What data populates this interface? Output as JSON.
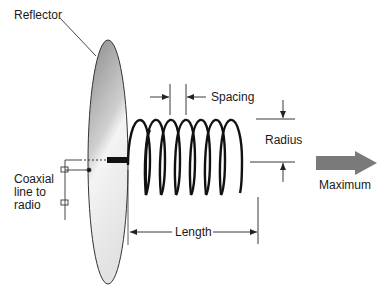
{
  "diagram": {
    "type": "helical antenna",
    "labels": {
      "reflector": "Reflector",
      "spacing": "Spacing",
      "radius": "Radius",
      "coax_line1": "Coaxial",
      "coax_line2": "line to",
      "coax_line3": "radio",
      "length": "Length",
      "maximum": "Maximum"
    },
    "colors": {
      "reflector_dark": "#8c8c8c",
      "reflector_light": "#f2f2f2",
      "coil": "#111111",
      "arrow": "#7a7a7a",
      "line": "#222222"
    },
    "coil_turns": 8
  }
}
